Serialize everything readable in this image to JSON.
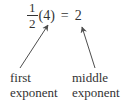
{
  "equation": {
    "numerator": "1",
    "denominator": "2",
    "multiplicand": "(4)",
    "equals_sign": "=",
    "result": "2"
  },
  "annotations": {
    "first": {
      "line1": "first",
      "line2": "exponent"
    },
    "middle": {
      "line1": "middle",
      "line2": "exponent"
    }
  },
  "colors": {
    "text": "#333333",
    "arrow": "#4d4d4d",
    "background": "#ffffff"
  }
}
